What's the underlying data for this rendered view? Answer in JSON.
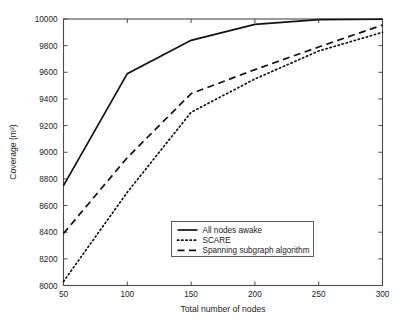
{
  "chart_data": {
    "type": "line",
    "title": "",
    "xlabel": "Total number of nodes",
    "ylabel": "Coverage (m²)",
    "xlim": [
      50,
      300
    ],
    "ylim": [
      8000,
      10000
    ],
    "xticks": [
      50,
      100,
      150,
      200,
      250,
      300
    ],
    "yticks": [
      8000,
      8200,
      8400,
      8600,
      8800,
      9000,
      9200,
      9400,
      9600,
      9800,
      10000
    ],
    "xtick_labels": [
      "50",
      "100",
      "150",
      "200",
      "250",
      "300"
    ],
    "ytick_labels": [
      "8000",
      "8200",
      "8400",
      "8600",
      "8800",
      "9000",
      "9200",
      "9400",
      "9600",
      "9800",
      "10000"
    ],
    "grid": false,
    "legend_position": "lower center",
    "x": [
      50,
      100,
      150,
      200,
      250,
      300
    ],
    "series": [
      {
        "name": "All nodes awake",
        "style": "solid",
        "color": "#121212",
        "values": [
          8750,
          9590,
          9840,
          9960,
          9995,
          9998
        ]
      },
      {
        "name": "SCARE",
        "style": "dotted",
        "color": "#121212",
        "values": [
          8030,
          8700,
          9300,
          9550,
          9760,
          9900
        ]
      },
      {
        "name": "Spanning subgraph algorithm",
        "style": "dashed",
        "color": "#121212",
        "values": [
          8390,
          8960,
          9440,
          9620,
          9790,
          9955
        ]
      }
    ]
  },
  "legend": {
    "entries": [
      {
        "label": "All nodes awake",
        "style": "solid"
      },
      {
        "label": "SCARE",
        "style": "dotted"
      },
      {
        "label": "Spanning subgraph algorithm",
        "style": "dashed"
      }
    ]
  },
  "axes": {
    "x_title": "Total number of nodes",
    "y_title": "Coverage (m²)"
  },
  "colors": {
    "series": "#121212",
    "axis": "#4a4a4a",
    "background": "#ffffff",
    "text": "#1a1a1a"
  }
}
